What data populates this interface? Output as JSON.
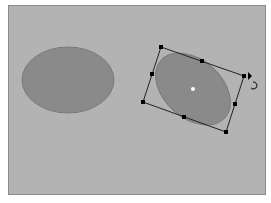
{
  "canvas": {
    "background": "#b3b3b3",
    "border": "#8c8c8c"
  },
  "shapes": [
    {
      "id": "ellipse-1",
      "type": "ellipse",
      "cx": 68,
      "cy": 80,
      "rx": 46,
      "ry": 33,
      "rotation": 0,
      "fill": "#8a8a8a",
      "stroke": "#7a7a7a",
      "selected": false
    },
    {
      "id": "ellipse-2",
      "type": "ellipse",
      "cx": 193,
      "cy": 89,
      "rx": 43,
      "ry": 29,
      "rotation": 42,
      "fill": "#8a8a8a",
      "stroke": "#7a7a7a",
      "selected": true
    }
  ],
  "selection": {
    "corners": [
      [
        161,
        47
      ],
      [
        244,
        76
      ],
      [
        226,
        132
      ],
      [
        143,
        102
      ]
    ],
    "handle_color": "#000000",
    "center_point": [
      193,
      89
    ],
    "rotate_cursor": "rotate-cursor-icon"
  }
}
